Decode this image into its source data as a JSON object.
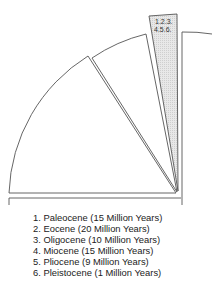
{
  "diagram": {
    "wedge_label_line1": "1.2.3.",
    "wedge_label_line2": "4.5.6.",
    "colors": {
      "stroke": "#555555",
      "shaded_fill": "#e4e4e4",
      "background": "#ffffff",
      "text": "#222222"
    }
  },
  "legend": {
    "items": [
      {
        "number": "1.",
        "label": "Paleocene (15 Million Years)"
      },
      {
        "number": "2.",
        "label": "Eocene (20 Million Years)"
      },
      {
        "number": "3.",
        "label": "Oligocene (10 Million Years)"
      },
      {
        "number": "4.",
        "label": "Miocene (15 Million Years)"
      },
      {
        "number": "5.",
        "label": "Pliocene (9 Million Years)"
      },
      {
        "number": "6.",
        "label": "Pleistocene (1 Million Years)"
      }
    ]
  }
}
